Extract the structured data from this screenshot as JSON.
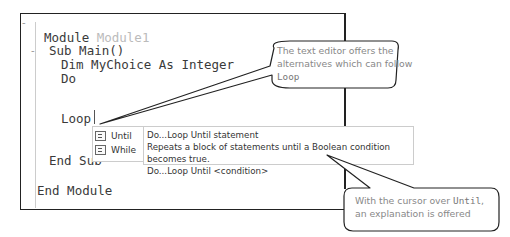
{
  "editor": {
    "lines": [
      {
        "keyword": "Module",
        "rest": " Module1"
      },
      {
        "text": "Sub Main()"
      },
      {
        "text": "Dim MyChoice As Integer"
      },
      {
        "text": "Do"
      },
      {
        "text": "Loop"
      },
      {
        "text": "End Sub"
      },
      {
        "text": "End Module"
      }
    ],
    "fold_markers": [
      "-",
      "-"
    ]
  },
  "completion_list": {
    "items": [
      {
        "label": "Until",
        "icon": "keyword-snippet-icon"
      },
      {
        "label": "While",
        "icon": "keyword-snippet-icon"
      }
    ]
  },
  "tooltip": {
    "title": "Do...Loop Until statement",
    "description": "Repeats a block of statements until a Boolean condition becomes true.",
    "syntax": "Do...Loop Until <condition>"
  },
  "callouts": {
    "top": {
      "line1": "The text editor offers the",
      "line2": "alternatives which can follow",
      "code": "Loop"
    },
    "bottom": {
      "prefix": "With the cursor over ",
      "code": "Until",
      "suffix": ",",
      "line2": "an explanation is offered"
    }
  }
}
